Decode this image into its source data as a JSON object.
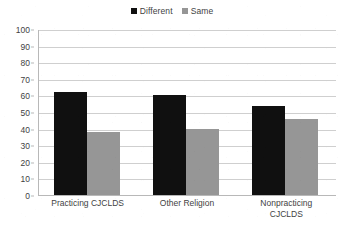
{
  "chart_data": {
    "type": "bar",
    "title": "",
    "subtitle": "",
    "xlabel": "",
    "ylabel": "",
    "ylim": [
      0,
      100
    ],
    "ytick_step": 10,
    "ytick_labels": [
      "100",
      "90",
      "80",
      "70",
      "60",
      "50",
      "40",
      "30",
      "20",
      "10",
      "0"
    ],
    "grid": true,
    "legend_position": "top-center",
    "categories": [
      "Practicing CJCLDS",
      "Other Religion",
      "Nonpracticing CJCLDS"
    ],
    "category_label_lines": [
      [
        "Practicing CJCLDS"
      ],
      [
        "Other Religion"
      ],
      [
        "Nonpracticing",
        "CJCLDS"
      ]
    ],
    "series": [
      {
        "name": "Different",
        "color": "#101010",
        "values": [
          62,
          60,
          53.5
        ]
      },
      {
        "name": "Same",
        "color": "#969696",
        "values": [
          38,
          39.5,
          45.5
        ]
      }
    ]
  },
  "legend": {
    "entries": [
      {
        "label": "Different",
        "color": "#101010"
      },
      {
        "label": "Same",
        "color": "#969696"
      }
    ]
  },
  "colors": {
    "different": "#101010",
    "same": "#969696",
    "gridline": "#cfcfcf",
    "axis": "#b8b8b8",
    "text": "#3f3f3f",
    "background": "#ffffff"
  }
}
